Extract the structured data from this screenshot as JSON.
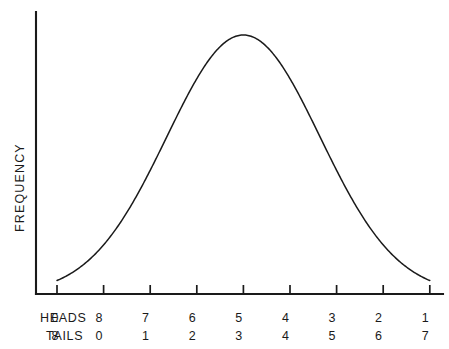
{
  "chart_data": {
    "type": "line",
    "title": "",
    "xlabel": "",
    "ylabel": "FREQUENCY",
    "grid": false,
    "legend": null,
    "axis_rows": [
      {
        "name": "HEADS",
        "tick_labels": [
          "8",
          "7",
          "6",
          "5",
          "4",
          "3",
          "2",
          "1",
          "0"
        ]
      },
      {
        "name": "TAILS",
        "tick_labels": [
          "0",
          "1",
          "2",
          "3",
          "4",
          "5",
          "6",
          "7",
          "8"
        ]
      }
    ],
    "x": [
      0,
      1,
      2,
      3,
      4,
      5,
      6,
      7,
      8
    ],
    "values": [
      0.004,
      0.19,
      0.48,
      0.83,
      1.0,
      0.83,
      0.48,
      0.19,
      0.004
    ],
    "ylim": [
      0,
      1.06
    ],
    "xlim": [
      0,
      8
    ],
    "peak_x": 4,
    "series_name": "Frequency distribution",
    "curve_color": "#1a1a1a",
    "axis_color": "#1a1a1a",
    "background_color": "#ffffff"
  },
  "geometry": {
    "origin_x": 36,
    "origin_y": 294,
    "axis_top_y": 12,
    "axis_right_x": 443,
    "tick_x_start": 57,
    "tick_spacing": 46.6,
    "tick_height": 9,
    "peak_y": 35,
    "row_label_y": [
      318,
      336
    ],
    "row_name_x": 40
  }
}
